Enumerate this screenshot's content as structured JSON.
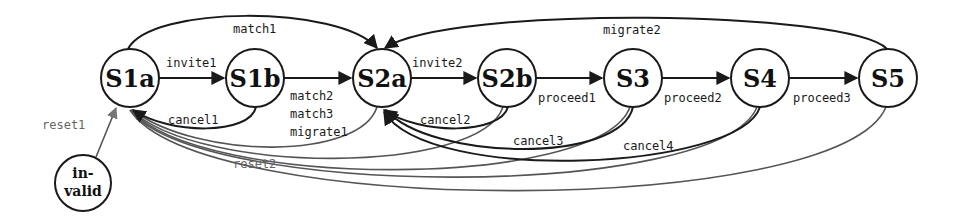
{
  "diagram": {
    "type": "state-machine",
    "nodes": [
      {
        "id": "S1a",
        "label": "S1a"
      },
      {
        "id": "S1b",
        "label": "S1b"
      },
      {
        "id": "S2a",
        "label": "S2a"
      },
      {
        "id": "S2b",
        "label": "S2b"
      },
      {
        "id": "S3",
        "label": "S3"
      },
      {
        "id": "S4",
        "label": "S4"
      },
      {
        "id": "S5",
        "label": "S5"
      },
      {
        "id": "invalid",
        "label_line1": "in-",
        "label_line2": "valid"
      }
    ],
    "edges": [
      {
        "from": "S1a",
        "to": "S1b",
        "label": "invite1"
      },
      {
        "from": "S1b",
        "to": "S1a",
        "label": "cancel1"
      },
      {
        "from": "S1a",
        "to": "S2a",
        "label": "match1"
      },
      {
        "from": "S1b",
        "to": "S2a",
        "label_lines": [
          "match2",
          "match3",
          "migrate1"
        ]
      },
      {
        "from": "S2a",
        "to": "S2b",
        "label": "invite2"
      },
      {
        "from": "S2b",
        "to": "S2a",
        "label": "cancel2"
      },
      {
        "from": "S2b",
        "to": "S3",
        "label": "proceed1"
      },
      {
        "from": "S3",
        "to": "S2a",
        "label": "cancel3"
      },
      {
        "from": "S3",
        "to": "S4",
        "label": "proceed2"
      },
      {
        "from": "S4",
        "to": "S2a",
        "label": "cancel4"
      },
      {
        "from": "S4",
        "to": "S5",
        "label": "proceed3"
      },
      {
        "from": "S5",
        "to": "S2a",
        "label": "migrate2"
      },
      {
        "from": "invalid",
        "to": "S1a",
        "label": "reset1"
      },
      {
        "from": "S2a",
        "to": "S1a",
        "label": "reset2"
      },
      {
        "from": "S2b",
        "to": "S1a",
        "label": ""
      },
      {
        "from": "S3",
        "to": "S1a",
        "label": ""
      },
      {
        "from": "S4",
        "to": "S1a",
        "label": ""
      },
      {
        "from": "S5",
        "to": "S1a",
        "label": ""
      }
    ],
    "colors": {
      "primary_edge": "#1a1a1a",
      "reset_edge": "#555555",
      "reset_label": "#666666"
    }
  }
}
